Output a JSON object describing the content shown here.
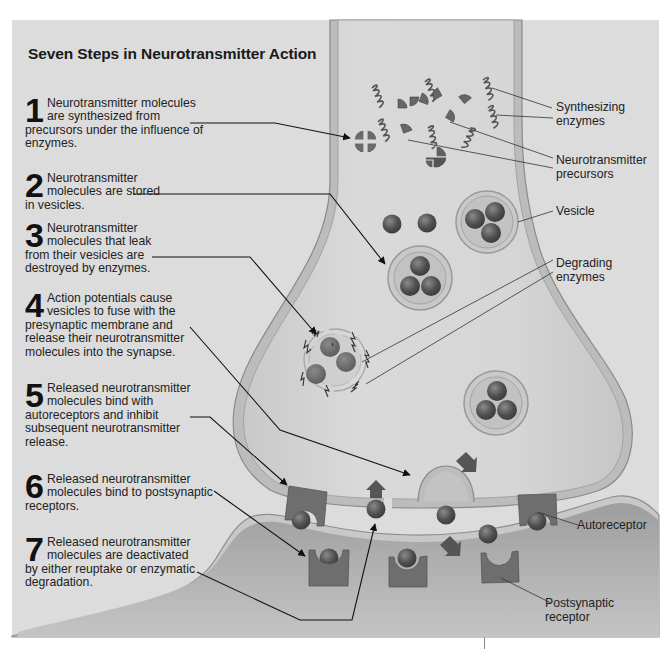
{
  "title": "Seven Steps in Neurotransmitter Action",
  "steps": [
    {
      "number": "1",
      "text": "Neurotransmitter molecules are synthesized from precursors under the influence of enzymes."
    },
    {
      "number": "2",
      "text": "Neurotransmitter molecules are stored in vesicles."
    },
    {
      "number": "3",
      "text": "Neurotransmitter molecules that leak from their vesicles are destroyed by enzymes."
    },
    {
      "number": "4",
      "text": "Action potentials cause vesicles to fuse with the presynaptic membrane and release their neurotransmitter molecules into the synapse."
    },
    {
      "number": "5",
      "text": "Released neurotransmitter molecules bind with autoreceptors and inhibit subsequent neurotransmitter release."
    },
    {
      "number": "6",
      "text": "Released neurotransmitter molecules bind to postsynaptic receptors."
    },
    {
      "number": "7",
      "text": "Released neurotransmitter molecules are deactivated by either reuptake or enzymatic degradation."
    }
  ],
  "labels": {
    "synthesizing_enzymes": "Synthesizing enzymes",
    "precursors": "Neurotransmitter precursors",
    "vesicle": "Vesicle",
    "degrading_enzymes": "Degrading enzymes",
    "autoreceptor": "Autoreceptor",
    "postsynaptic_receptor": "Postsynaptic receptor"
  },
  "colors": {
    "panel": "#dcdcdc",
    "cell_fill": "#d2d2d2",
    "membrane": "#c4c4c4",
    "membrane_edge": "#8a8a8a",
    "molecule": "#555555",
    "receptor": "#6e6e6e",
    "leader_line": "#111111"
  }
}
